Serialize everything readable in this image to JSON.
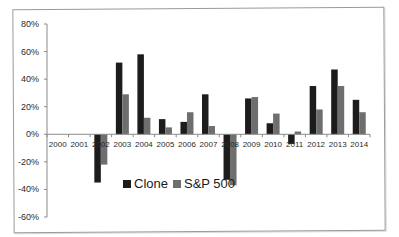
{
  "chart_data": {
    "type": "bar",
    "title": "",
    "xlabel": "",
    "ylabel": "",
    "categories": [
      "2000",
      "2001",
      "2002",
      "2003",
      "2004",
      "2005",
      "2006",
      "2007",
      "2008",
      "2009",
      "2010",
      "2011",
      "2012",
      "2013",
      "2014"
    ],
    "series": [
      {
        "name": "Clone",
        "color": "#1c1c1c",
        "values": [
          0,
          0,
          -35,
          52,
          58,
          11,
          9,
          29,
          -33,
          26,
          8,
          -7,
          35,
          47,
          25
        ]
      },
      {
        "name": "S&P 500",
        "color": "#6e6e6e",
        "values": [
          0,
          0,
          -22,
          29,
          12,
          5,
          16,
          6,
          -37,
          27,
          15,
          2,
          18,
          35,
          16
        ]
      }
    ],
    "ylim": [
      -60,
      80
    ],
    "yticks": [
      "80%",
      "60%",
      "40%",
      "20%",
      "0%",
      "-20%",
      "-40%",
      "-60%"
    ],
    "grid": false,
    "legend_position": "inside-center-left"
  },
  "legend": {
    "items": [
      {
        "label": "Clone",
        "color": "#1c1c1c"
      },
      {
        "label": "S&P 500",
        "color": "#6e6e6e"
      }
    ]
  }
}
